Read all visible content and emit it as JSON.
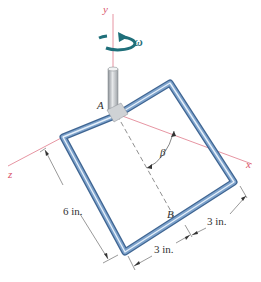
{
  "figure": {
    "axes": {
      "x_label": "x",
      "y_label": "y",
      "z_label": "z",
      "color": "#d9536a"
    },
    "angular_velocity": {
      "label": "ω",
      "color": "#1f6f7a"
    },
    "points": {
      "A": "A",
      "B": "B"
    },
    "angle_label": "β",
    "dimensions": {
      "left_side": "6 in.",
      "bottom_segment": "3 in.",
      "right_segment": "3 in."
    },
    "pipe_color": "#5d86b5",
    "shaft_color": "#b8bcc0"
  }
}
